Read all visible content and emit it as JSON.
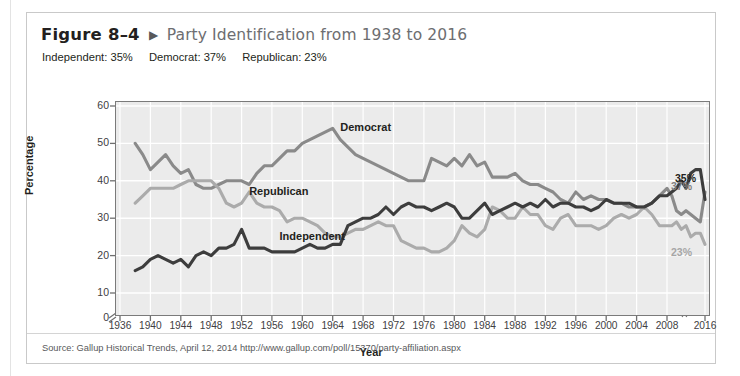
{
  "figure": {
    "number": "Figure 8–4",
    "arrow_icon": "triangle-right-icon",
    "title": "Party Identification from 1938 to 2016",
    "subtitle_items": [
      "Independent: 35%",
      "Democrat: 37%",
      "Republican: 23%"
    ],
    "source": "Source: Gallup Historical Trends, April 12, 2014 http://www.gallup.com/poll/15370/party-affiliation.aspx"
  },
  "chart_data": {
    "type": "line",
    "title": "Party Identification from 1938 to 2016",
    "xlabel": "Year",
    "ylabel": "Percentage",
    "xlim": [
      1936,
      2016
    ],
    "ylim": [
      0,
      60
    ],
    "yticks": [
      0,
      10,
      20,
      30,
      40,
      50,
      60
    ],
    "xticks": [
      1936,
      1940,
      1944,
      1948,
      1952,
      1956,
      1960,
      1964,
      1968,
      1972,
      1976,
      1980,
      1984,
      1988,
      1992,
      1996,
      2000,
      2004,
      2008,
      2016
    ],
    "axis_break_y": true,
    "axis_break_x": true,
    "grid": true,
    "legend_position": "inline-annotations",
    "colors": {
      "independent": "#3d3d3d",
      "democrat": "#8a8a8a",
      "republican": "#ababab",
      "plot_background": "#ebebeb",
      "gridline": "#ffffff",
      "axis": "#6f6f6f"
    },
    "annotations": [
      {
        "text": "Democrat",
        "x": 1965,
        "y": 54
      },
      {
        "text": "Republican",
        "x": 1953,
        "y": 37
      },
      {
        "text": "Independent",
        "x": 1957,
        "y": 25
      }
    ],
    "end_labels": [
      {
        "text": "35%",
        "series": "Independent",
        "value": 35,
        "color": "#231f20"
      },
      {
        "text": "37%",
        "series": "Democrat",
        "value": 37,
        "color": "#808080"
      },
      {
        "text": "23%",
        "series": "Republican",
        "value": 23,
        "color": "#a6a6a6"
      }
    ],
    "x": [
      1938,
      1939,
      1940,
      1941,
      1942,
      1943,
      1944,
      1945,
      1946,
      1947,
      1948,
      1949,
      1950,
      1951,
      1952,
      1953,
      1954,
      1955,
      1956,
      1957,
      1958,
      1959,
      1960,
      1961,
      1962,
      1963,
      1964,
      1965,
      1966,
      1967,
      1968,
      1969,
      1970,
      1971,
      1972,
      1973,
      1974,
      1975,
      1976,
      1977,
      1978,
      1979,
      1980,
      1981,
      1982,
      1983,
      1984,
      1985,
      1986,
      1987,
      1988,
      1989,
      1990,
      1991,
      1992,
      1993,
      1994,
      1995,
      1996,
      1997,
      1998,
      1999,
      2000,
      2001,
      2002,
      2003,
      2004,
      2005,
      2006,
      2007,
      2008,
      2009,
      2010,
      2011,
      2012,
      2013,
      2014,
      2015,
      2016
    ],
    "series": [
      {
        "name": "Democrat",
        "color": "#8a8a8a",
        "values": [
          50,
          47,
          43,
          45,
          47,
          44,
          42,
          43,
          39,
          38,
          38,
          39,
          40,
          40,
          40,
          39,
          42,
          44,
          44,
          46,
          48,
          48,
          50,
          51,
          52,
          53,
          54,
          51,
          49,
          47,
          46,
          45,
          44,
          43,
          42,
          41,
          40,
          40,
          40,
          46,
          45,
          44,
          46,
          44,
          47,
          44,
          45,
          41,
          41,
          41,
          42,
          40,
          39,
          39,
          38,
          37,
          35,
          34,
          37,
          35,
          36,
          35,
          35,
          34,
          34,
          33,
          33,
          33,
          34,
          36,
          38,
          36,
          32,
          31,
          32,
          31,
          30,
          29,
          37
        ],
        "end_value": 37
      },
      {
        "name": "Republican",
        "color": "#ababab",
        "values": [
          34,
          36,
          38,
          38,
          38,
          38,
          39,
          40,
          40,
          40,
          40,
          38,
          34,
          33,
          34,
          37,
          34,
          33,
          33,
          32,
          29,
          30,
          30,
          29,
          28,
          26,
          25,
          25,
          26,
          27,
          27,
          28,
          29,
          28,
          28,
          24,
          23,
          22,
          22,
          21,
          21,
          22,
          24,
          28,
          26,
          25,
          27,
          33,
          32,
          30,
          30,
          33,
          31,
          31,
          28,
          27,
          30,
          31,
          28,
          28,
          28,
          27,
          28,
          30,
          31,
          30,
          31,
          33,
          31,
          28,
          28,
          28,
          29,
          27,
          28,
          25,
          26,
          26,
          23
        ],
        "end_value": 23
      },
      {
        "name": "Independent",
        "color": "#3d3d3d",
        "values": [
          16,
          17,
          19,
          20,
          19,
          18,
          19,
          17,
          20,
          21,
          20,
          22,
          22,
          23,
          27,
          22,
          22,
          22,
          21,
          21,
          21,
          21,
          22,
          23,
          22,
          22,
          23,
          23,
          28,
          29,
          30,
          30,
          31,
          33,
          31,
          33,
          34,
          33,
          33,
          32,
          33,
          34,
          33,
          30,
          30,
          32,
          34,
          31,
          32,
          33,
          34,
          33,
          34,
          33,
          35,
          33,
          34,
          34,
          33,
          33,
          32,
          33,
          35,
          34,
          34,
          34,
          33,
          33,
          34,
          36,
          36,
          37,
          38,
          40,
          38,
          42,
          43,
          43,
          35
        ],
        "end_value": 35
      }
    ]
  }
}
